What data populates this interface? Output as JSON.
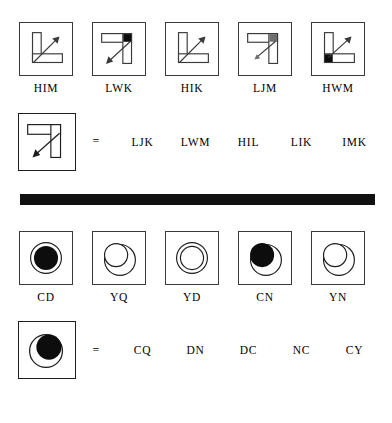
{
  "colors": {
    "ink": "#000000",
    "box_border": "#3a3a3a",
    "query_border": "#1d1d1d",
    "divider": "#111111",
    "fill_black": "#0d0d0d",
    "fill_gray": "#6e6e6e",
    "stroke": "#3a3a3a"
  },
  "puzzle_one": {
    "cards": [
      {
        "label": "HIM",
        "shape": "L-bracket",
        "corner_fill": "none",
        "arrow_direction": "up-right"
      },
      {
        "label": "LWK",
        "shape": "7-bracket",
        "corner_fill": "black",
        "arrow_direction": "down-left"
      },
      {
        "label": "HIK",
        "shape": "L-bracket",
        "corner_fill": "none",
        "arrow_direction": "up-right"
      },
      {
        "label": "LJM",
        "shape": "7-bracket",
        "corner_fill": "gray",
        "arrow_direction": "down-left"
      },
      {
        "label": "HWM",
        "shape": "L-bracket",
        "corner_fill": "black",
        "arrow_direction": "up-right"
      }
    ],
    "query": {
      "shape": "7-bracket",
      "corner_fill": "none",
      "arrow_direction": "down-left",
      "equals": "=",
      "options": [
        "LJK",
        "LWM",
        "HIL",
        "LIK",
        "IMK"
      ]
    }
  },
  "puzzle_two": {
    "cards": [
      {
        "label": "CD",
        "inner_fill": "black",
        "inner_offset": "center",
        "outer": "circle"
      },
      {
        "label": "YQ",
        "inner_fill": "none",
        "inner_offset": "upper-left",
        "outer": "circle"
      },
      {
        "label": "YD",
        "inner_fill": "none",
        "inner_offset": "center",
        "outer": "circle"
      },
      {
        "label": "CN",
        "inner_fill": "black",
        "inner_offset": "upper-left",
        "outer": "circle"
      },
      {
        "label": "YN",
        "inner_fill": "none",
        "inner_offset": "upper-left",
        "outer": "circle"
      }
    ],
    "query": {
      "inner_fill": "black",
      "inner_offset": "upper-right",
      "outer": "circle",
      "equals": "=",
      "options": [
        "CQ",
        "DN",
        "DC",
        "NC",
        "CY"
      ]
    }
  }
}
